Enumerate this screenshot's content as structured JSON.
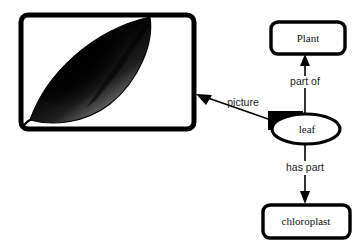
{
  "figure": {
    "background_color": "#ffffff",
    "ink_color": "#000000"
  },
  "picture_panel": {
    "name": "leaf-photograph",
    "caption": "",
    "subject": "leaf",
    "description": "dark shaded lens-shaped leaf with stem, tilted diagonally"
  },
  "nodes": [
    {
      "id": "plant",
      "label": "Plant",
      "shape": "rounded-rectangle"
    },
    {
      "id": "leaf",
      "label": "leaf",
      "shape": "ellipse"
    },
    {
      "id": "chloroplast",
      "label": "chloroplast",
      "shape": "rounded-rectangle"
    }
  ],
  "edges": [
    {
      "id": "part-of",
      "label": "part of",
      "from": "leaf",
      "to": "plant",
      "direction": "up"
    },
    {
      "id": "has-part",
      "label": "has part",
      "from": "leaf",
      "to": "chloroplast",
      "direction": "down"
    },
    {
      "id": "picture",
      "label": "picture",
      "from": "leaf",
      "to": "picture-panel",
      "direction": "up-left"
    }
  ]
}
